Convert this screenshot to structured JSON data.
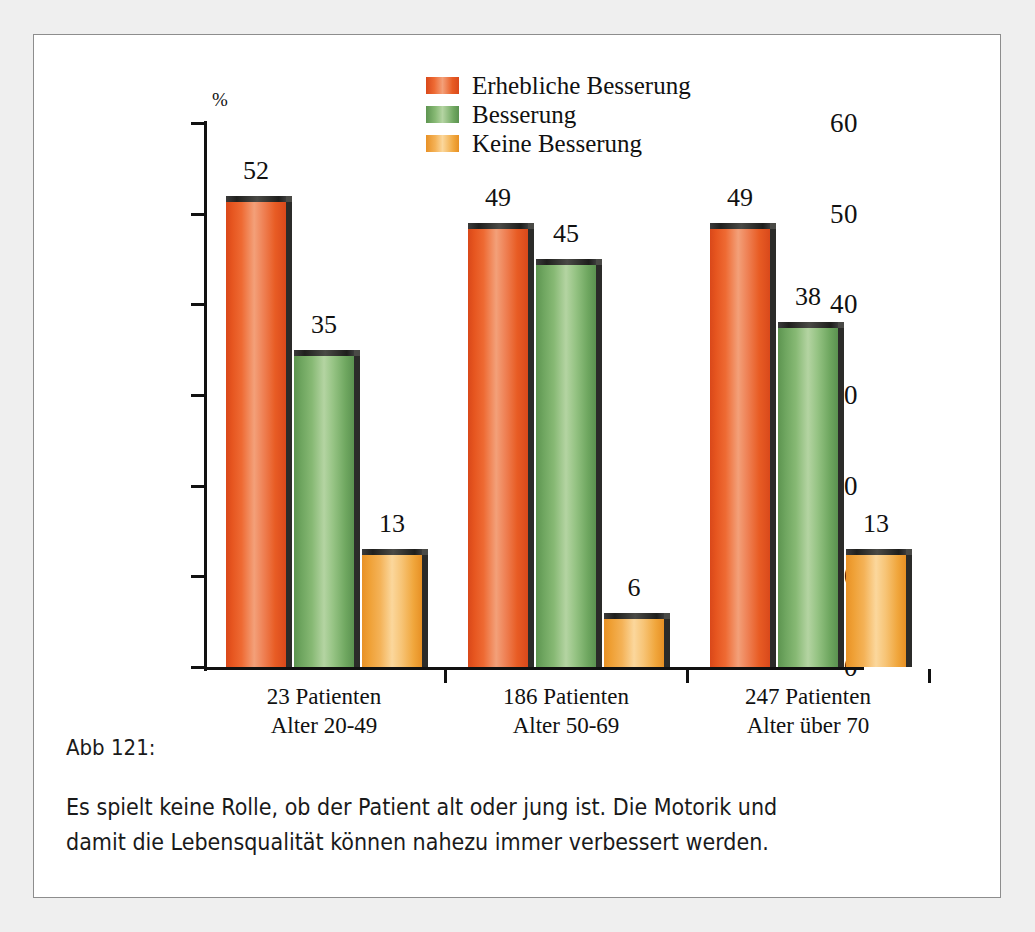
{
  "figure": {
    "caption_title": "Abb 121:",
    "caption_lines": [
      "Es spielt keine Rolle, ob der Patient alt oder jung ist. Die Motorik und",
      "damit die Lebensqualität können nahezu immer verbessert werden."
    ]
  },
  "colors": {
    "erhebliche_besserung": "#E8561F",
    "besserung": "#6FA860",
    "keine_besserung": "#EE9F32",
    "axis": "#111111",
    "frame": "#8D8D8D",
    "page_background": "#EFEFEF",
    "figure_background": "#FFFFFF"
  },
  "chart_data": {
    "type": "bar",
    "title": "",
    "xlabel": "",
    "ylabel": "%",
    "ylim": [
      0,
      60
    ],
    "yticks": [
      0,
      10,
      20,
      30,
      40,
      50,
      60
    ],
    "ytick_labels": [
      "0",
      "10",
      "20",
      "30",
      "40",
      "50",
      "60"
    ],
    "grid": false,
    "legend_position": "top-center",
    "value_labels": true,
    "categories": [
      "23 Patienten\nAlter 20-49",
      "186 Patienten\nAlter 50-69",
      "247 Patienten\nAlter über 70"
    ],
    "category_lines": [
      [
        "23 Patienten",
        "Alter 20-49"
      ],
      [
        "186 Patienten",
        "Alter 50-69"
      ],
      [
        "247 Patienten",
        "Alter über 70"
      ]
    ],
    "series": [
      {
        "name": "Erhebliche Besserung",
        "color": "#E8561F",
        "values": [
          52,
          49,
          49
        ]
      },
      {
        "name": "Besserung",
        "color": "#6FA860",
        "values": [
          35,
          45,
          38
        ]
      },
      {
        "name": "Keine Besserung",
        "color": "#EE9F32",
        "values": [
          13,
          6,
          13
        ]
      }
    ]
  }
}
